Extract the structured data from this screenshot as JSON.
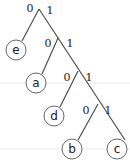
{
  "diagram": {
    "type": "binary-prefix-code-tree",
    "edge_labels": {
      "left": "0",
      "right": "1"
    },
    "leaves": [
      "e",
      "a",
      "d",
      "b",
      "c"
    ],
    "codes": {
      "e": "0",
      "a": "10",
      "d": "110",
      "b": "1110",
      "c": "1111"
    },
    "nodes": [
      {
        "id": "e",
        "label": "e"
      },
      {
        "id": "a",
        "label": "a"
      },
      {
        "id": "d",
        "label": "d"
      },
      {
        "id": "b",
        "label": "b"
      },
      {
        "id": "c",
        "label": "c"
      }
    ],
    "junction_labels": [
      {
        "zero": "0",
        "one": "1"
      },
      {
        "zero": "0",
        "one": "1"
      },
      {
        "zero": "0",
        "one": "1"
      },
      {
        "zero": "0",
        "one": "1"
      }
    ],
    "colors": {
      "edge": "#444444",
      "node_stroke": "#555555",
      "text": "#222222",
      "guide": "#ececec"
    }
  }
}
